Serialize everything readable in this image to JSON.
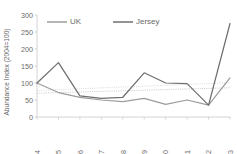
{
  "chart_data": {
    "type": "line",
    "title": "",
    "xlabel": "",
    "ylabel": "Abundance Index (2004=100)",
    "categories": [
      "2004",
      "2005",
      "2006",
      "2007",
      "2008",
      "2009",
      "2010",
      "2011",
      "2012",
      "2013"
    ],
    "ylim": [
      0,
      300
    ],
    "yticks": [
      0,
      50,
      100,
      150,
      200,
      250,
      300
    ],
    "grid": false,
    "legend_position": "top-center",
    "series": [
      {
        "name": "UK",
        "color": "#9c9c9c",
        "values": [
          100,
          72,
          58,
          50,
          45,
          55,
          37,
          50,
          35,
          115
        ]
      },
      {
        "name": "Jersey",
        "color": "#6f6f6f",
        "values": [
          100,
          160,
          62,
          55,
          58,
          130,
          100,
          98,
          35,
          275
        ]
      }
    ],
    "trendlines": [
      {
        "name": "UK-trend",
        "color": "#b8b8b8",
        "start_value": 70,
        "end_value": 86
      },
      {
        "name": "Jersey-trend",
        "color": "#cfcfcf",
        "start_value": 78,
        "end_value": 101
      }
    ]
  }
}
